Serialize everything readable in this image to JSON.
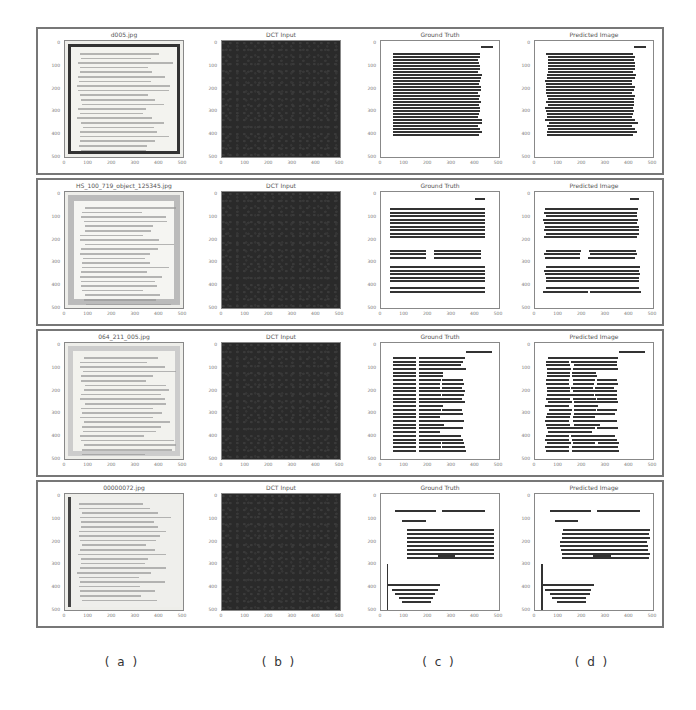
{
  "figure": {
    "columns": [
      {
        "id": "a",
        "caption": "( a )"
      },
      {
        "id": "b",
        "caption": "( b )"
      },
      {
        "id": "c",
        "caption": "( c )"
      },
      {
        "id": "d",
        "caption": "( d )"
      }
    ],
    "tick_labels": [
      "0",
      "100",
      "200",
      "300",
      "400",
      "500"
    ],
    "rows": [
      {
        "input_title": "d005.jpg",
        "dct_title": "DCT Input",
        "gt_title": "Ground Truth",
        "pred_title": "Predicted Image",
        "x_ticks": [
          "0",
          "100",
          "200",
          "300",
          "400",
          "500"
        ],
        "y_ticks": [
          "0",
          "100",
          "200",
          "300",
          "400",
          "500"
        ]
      },
      {
        "input_title": "HS_100_719_object_125345.jpg",
        "dct_title": "DCT Input",
        "gt_title": "Ground Truth",
        "pred_title": "Predicted Image",
        "x_ticks": [
          "0",
          "100",
          "200",
          "300",
          "400",
          "500"
        ],
        "y_ticks": [
          "0",
          "100",
          "200",
          "300",
          "400",
          "500"
        ]
      },
      {
        "input_title": "064_211_005.jpg",
        "dct_title": "DCT Input",
        "gt_title": "Ground Truth",
        "pred_title": "Predicted Image",
        "x_ticks": [
          "0",
          "100",
          "200",
          "300",
          "400",
          "500"
        ],
        "y_ticks": [
          "0",
          "100",
          "200",
          "300",
          "400",
          "500"
        ]
      },
      {
        "input_title": "00000072.jpg",
        "dct_title": "DCT Input",
        "gt_title": "Ground Truth",
        "pred_title": "Predicted Image",
        "x_ticks": [
          "0",
          "100",
          "200",
          "300",
          "400",
          "500"
        ],
        "y_ticks": [
          "0",
          "100",
          "200",
          "300",
          "400",
          "500"
        ]
      }
    ]
  },
  "colors": {
    "border": "#777777",
    "dct_background": "#2a2a2a",
    "text_line": "#333333",
    "paper": "#f3f3ef"
  }
}
